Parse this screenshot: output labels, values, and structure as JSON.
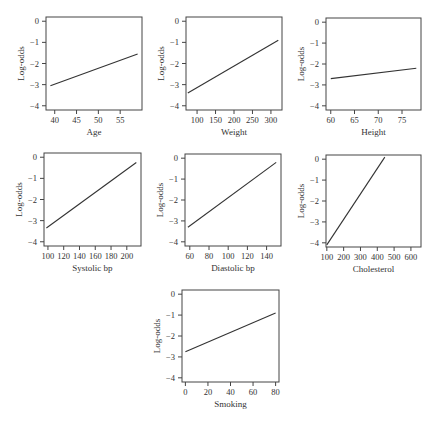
{
  "figure": {
    "ylabel": "Log-odds",
    "line_color": "#333333",
    "axis_color": "#444444"
  },
  "chart_data": [
    {
      "type": "line",
      "xlabel": "Age",
      "ylabel": "Log-odds",
      "xlim": [
        38,
        60
      ],
      "ylim": [
        -4.2,
        0.2
      ],
      "xticks": [
        40,
        45,
        50,
        55
      ],
      "yticks": [
        0,
        -1,
        -2,
        -3,
        -4
      ],
      "x": [
        39,
        59
      ],
      "y": [
        -3.05,
        -1.55
      ],
      "box": {
        "left": 46,
        "top": 17,
        "right": 142,
        "bottom": 110
      }
    },
    {
      "type": "line",
      "xlabel": "Weight",
      "ylabel": "Log-odds",
      "xlim": [
        70,
        330
      ],
      "ylim": [
        -4.2,
        0.2
      ],
      "xticks": [
        100,
        150,
        200,
        250,
        300
      ],
      "yticks": [
        0,
        -1,
        -2,
        -3,
        -4
      ],
      "x": [
        75,
        320
      ],
      "y": [
        -3.4,
        -0.9
      ],
      "box": {
        "left": 186,
        "top": 17,
        "right": 282,
        "bottom": 110
      }
    },
    {
      "type": "line",
      "xlabel": "Height",
      "ylabel": "Log-odds",
      "xlim": [
        59,
        79
      ],
      "ylim": [
        -4.2,
        0.2
      ],
      "xticks": [
        60,
        65,
        70,
        75
      ],
      "yticks": [
        0,
        -1,
        -2,
        -3,
        -4
      ],
      "x": [
        60,
        78
      ],
      "y": [
        -2.7,
        -2.2
      ],
      "box": {
        "left": 326,
        "top": 18,
        "right": 421,
        "bottom": 110
      }
    },
    {
      "type": "line",
      "xlabel": "Systolic bp",
      "ylabel": "Log-odds",
      "xlim": [
        95,
        218
      ],
      "ylim": [
        -4.2,
        0.2
      ],
      "xticks": [
        100,
        120,
        140,
        160,
        180,
        200
      ],
      "yticks": [
        0,
        -1,
        -2,
        -3,
        -4
      ],
      "x": [
        98,
        212
      ],
      "y": [
        -3.35,
        -0.25
      ],
      "box": {
        "left": 44,
        "top": 153,
        "right": 141,
        "bottom": 246
      }
    },
    {
      "type": "line",
      "xlabel": "Diastolic bp",
      "ylabel": "Log-odds",
      "xlim": [
        55,
        155
      ],
      "ylim": [
        -4.2,
        0.2
      ],
      "xticks": [
        60,
        80,
        100,
        120,
        140
      ],
      "yticks": [
        0,
        -1,
        -2,
        -3,
        -4
      ],
      "x": [
        58,
        150
      ],
      "y": [
        -3.3,
        -0.2
      ],
      "box": {
        "left": 185,
        "top": 154,
        "right": 281,
        "bottom": 246
      }
    },
    {
      "type": "line",
      "xlabel": "Cholesterol",
      "ylabel": "Log-odds",
      "xlim": [
        95,
        660
      ],
      "ylim": [
        -4.2,
        0.2
      ],
      "xticks": [
        100,
        200,
        300,
        400,
        500,
        600
      ],
      "yticks": [
        0,
        -1,
        -2,
        -3,
        -4
      ],
      "x": [
        100,
        445
      ],
      "y": [
        -4.1,
        0.1
      ],
      "box": {
        "left": 326,
        "top": 155,
        "right": 421,
        "bottom": 247
      }
    },
    {
      "type": "line",
      "xlabel": "Smoking",
      "ylabel": "Log-odds",
      "xlim": [
        -3,
        83
      ],
      "ylim": [
        -4.2,
        0.2
      ],
      "xticks": [
        0,
        20,
        40,
        60,
        80
      ],
      "yticks": [
        0,
        -1,
        -2,
        -3,
        -4
      ],
      "x": [
        0,
        80
      ],
      "y": [
        -2.75,
        -0.9
      ],
      "box": {
        "left": 182,
        "top": 290,
        "right": 279,
        "bottom": 382
      }
    }
  ]
}
